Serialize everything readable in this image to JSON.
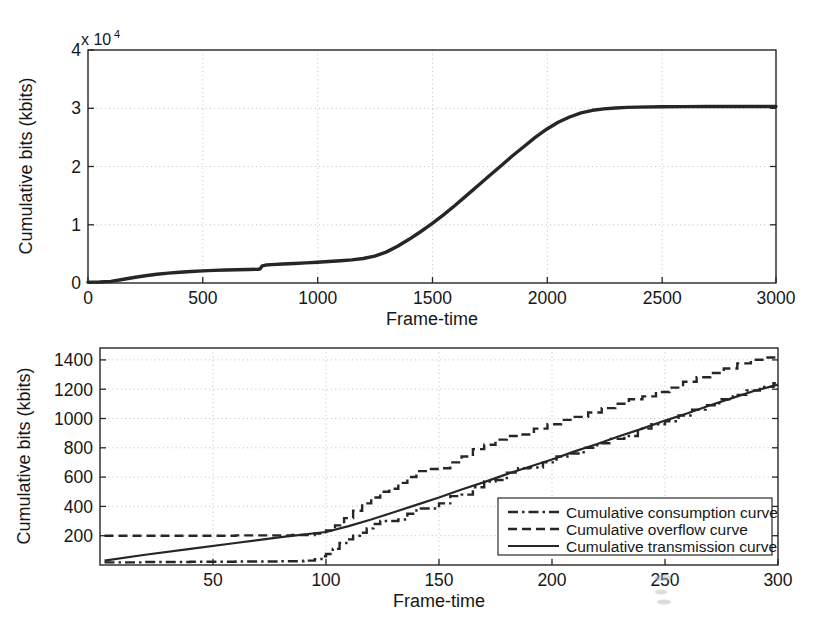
{
  "figure": {
    "background": "#ffffff",
    "line_color": "#262626",
    "grid_color": "#b9b9b9"
  },
  "chart_data": [
    {
      "id": "top-chart",
      "type": "line",
      "title": "",
      "xlabel": "Frame-time",
      "ylabel": "Cumulative bits (kbits)",
      "y_multiplier": "x 10",
      "y_multiplier_exponent": "4",
      "xlim": [
        0,
        3000
      ],
      "ylim": [
        0,
        40000
      ],
      "xticks": [
        0,
        500,
        1000,
        1500,
        2000,
        2500,
        3000
      ],
      "xtick_labels": [
        "0",
        "500",
        "1000",
        "1500",
        "2000",
        "2500",
        "3000"
      ],
      "yticks": [
        0,
        10000,
        20000,
        30000,
        40000
      ],
      "ytick_labels": [
        "0",
        "1",
        "2",
        "3",
        "4"
      ],
      "grid": true,
      "legend": "none",
      "series": [
        {
          "name": "Cumulative bits",
          "style": "solid-thick",
          "x": [
            0,
            50,
            100,
            150,
            200,
            250,
            300,
            350,
            400,
            450,
            500,
            550,
            600,
            650,
            700,
            740,
            750,
            760,
            775,
            800,
            850,
            900,
            950,
            1000,
            1050,
            1100,
            1150,
            1200,
            1250,
            1300,
            1350,
            1400,
            1450,
            1500,
            1550,
            1600,
            1650,
            1700,
            1750,
            1800,
            1850,
            1900,
            1950,
            2000,
            2050,
            2100,
            2150,
            2200,
            2250,
            2300,
            2350,
            2400,
            2500,
            2600,
            2700,
            2800,
            2900,
            3000
          ],
          "y": [
            150,
            180,
            280,
            600,
            950,
            1250,
            1500,
            1700,
            1850,
            1980,
            2080,
            2160,
            2220,
            2280,
            2320,
            2360,
            2400,
            2950,
            3080,
            3150,
            3250,
            3350,
            3450,
            3550,
            3680,
            3820,
            3980,
            4200,
            4600,
            5300,
            6300,
            7500,
            8800,
            10200,
            11700,
            13300,
            15000,
            16700,
            18400,
            20100,
            21800,
            23400,
            25000,
            26400,
            27600,
            28500,
            29200,
            29650,
            29900,
            30050,
            30150,
            30200,
            30250,
            30280,
            30290,
            30300,
            30300,
            30300
          ]
        }
      ]
    },
    {
      "id": "bottom-chart",
      "type": "line",
      "title": "",
      "xlabel": "Frame-time",
      "ylabel": "Cumulative bits (kbits)",
      "xlim": [
        0,
        300
      ],
      "ylim": [
        0,
        1480
      ],
      "xticks": [
        50,
        100,
        150,
        200,
        250,
        300
      ],
      "xtick_labels": [
        "50",
        "100",
        "150",
        "200",
        "250",
        "300"
      ],
      "yticks": [
        200,
        400,
        600,
        800,
        1000,
        1200,
        1400
      ],
      "ytick_labels": [
        "200",
        "400",
        "600",
        "800",
        "1000",
        "1200",
        "1400"
      ],
      "grid": true,
      "legend": "lower-right",
      "series": [
        {
          "name": "Cumulative consumption curve",
          "style": "dash-dot",
          "x": [
            2,
            20,
            40,
            60,
            80,
            90,
            95,
            98,
            100,
            103,
            106,
            109,
            112,
            115,
            118,
            121,
            124,
            128,
            132,
            136,
            140,
            145,
            150,
            155,
            160,
            165,
            170,
            175,
            180,
            185,
            190,
            196,
            202,
            208,
            214,
            220,
            226,
            232,
            238,
            244,
            250,
            256,
            262,
            268,
            274,
            280,
            286,
            292,
            298,
            300
          ],
          "y": [
            18,
            20,
            22,
            24,
            26,
            30,
            40,
            60,
            75,
            110,
            150,
            175,
            200,
            220,
            250,
            280,
            300,
            300,
            310,
            350,
            385,
            385,
            420,
            470,
            480,
            530,
            570,
            580,
            630,
            660,
            665,
            700,
            740,
            760,
            800,
            830,
            860,
            880,
            930,
            960,
            980,
            1020,
            1060,
            1090,
            1130,
            1160,
            1190,
            1215,
            1240,
            1250
          ]
        },
        {
          "name": "Cumulative overflow curve",
          "style": "dashed",
          "x": [
            2,
            30,
            60,
            85,
            95,
            100,
            104,
            108,
            112,
            116,
            120,
            124,
            128,
            132,
            136,
            140,
            145,
            150,
            155,
            160,
            165,
            170,
            175,
            180,
            186,
            192,
            198,
            204,
            210,
            216,
            222,
            228,
            234,
            240,
            246,
            252,
            258,
            264,
            270,
            276,
            282,
            288,
            294,
            300
          ],
          "y": [
            200,
            200,
            202,
            205,
            215,
            235,
            270,
            320,
            370,
            420,
            460,
            500,
            520,
            560,
            600,
            640,
            655,
            660,
            700,
            740,
            790,
            820,
            855,
            880,
            890,
            930,
            960,
            990,
            1010,
            1040,
            1070,
            1100,
            1130,
            1150,
            1180,
            1210,
            1250,
            1280,
            1310,
            1340,
            1375,
            1400,
            1415,
            1420
          ]
        },
        {
          "name": "Cumulative transmission curve",
          "style": "solid",
          "x": [
            2,
            20,
            40,
            60,
            80,
            100,
            110,
            120,
            130,
            140,
            150,
            160,
            170,
            180,
            190,
            200,
            210,
            220,
            230,
            240,
            250,
            260,
            270,
            280,
            290,
            300
          ],
          "y": [
            30,
            70,
            110,
            150,
            190,
            225,
            265,
            310,
            360,
            410,
            460,
            515,
            565,
            620,
            670,
            720,
            775,
            825,
            880,
            930,
            985,
            1035,
            1090,
            1140,
            1190,
            1230
          ]
        }
      ]
    }
  ],
  "legend": {
    "items": [
      {
        "label": "Cumulative consumption curve",
        "style": "dash-dot"
      },
      {
        "label": "Cumulative overflow curve",
        "style": "dashed"
      },
      {
        "label": "Cumulative transmission curve",
        "style": "solid"
      }
    ]
  }
}
